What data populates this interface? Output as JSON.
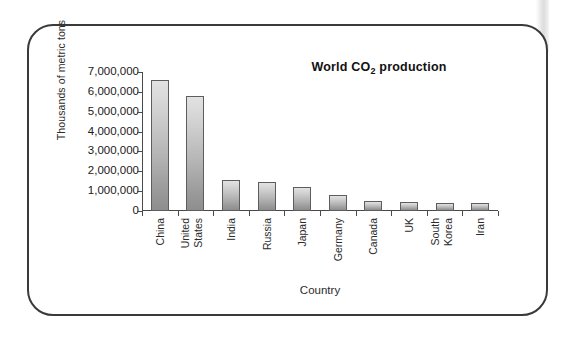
{
  "figure": {
    "frame_border_color": "#3a3a3a",
    "background_color": "#ffffff"
  },
  "chart_data": {
    "type": "bar",
    "title": "World CO",
    "title_sub": "2",
    "title_suffix": " production",
    "title_full": "World CO2 production",
    "xlabel": "Country",
    "ylabel": "Thousands of metric tons",
    "categories": [
      "China",
      "United States",
      "India",
      "Russia",
      "Japan",
      "Germany",
      "Canada",
      "UK",
      "South Korea",
      "Iran"
    ],
    "category_lines": [
      [
        "China"
      ],
      [
        "United",
        "States"
      ],
      [
        "India"
      ],
      [
        "Russia"
      ],
      [
        "Japan"
      ],
      [
        "Germany"
      ],
      [
        "Canada"
      ],
      [
        "UK"
      ],
      [
        "South",
        "Korea"
      ],
      [
        "Iran"
      ]
    ],
    "values": [
      6620000,
      5800000,
      1560000,
      1460000,
      1210000,
      790000,
      490000,
      460000,
      420000,
      400000
    ],
    "ylim": [
      0,
      7000000
    ],
    "ytick_values": [
      0,
      1000000,
      2000000,
      3000000,
      4000000,
      5000000,
      6000000,
      7000000
    ],
    "ytick_labels": [
      "0",
      "1,000,000",
      "2,000,000",
      "3,000,000",
      "4,000,000",
      "5,000,000",
      "6,000,000",
      "7,000,000"
    ],
    "grid": false,
    "legend": false,
    "bar_fill_top": "#e2e2e2",
    "bar_fill_bottom": "#8e8e8e",
    "bar_edge_color": "#5d5d5d",
    "axis_color": "#4a4a4a"
  }
}
